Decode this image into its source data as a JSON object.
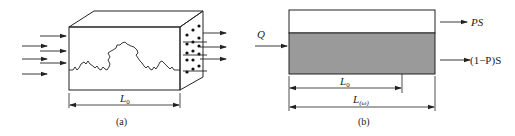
{
  "panels": [
    {
      "id": "a",
      "caption": "(a)",
      "dimension_label": "L",
      "dimension_sub": "0"
    },
    {
      "id": "b",
      "caption": "(b)",
      "input_label": "Q",
      "output_top_label": "PS",
      "output_bottom_label": "(1−P)S",
      "dim_inner_label": "L",
      "dim_inner_sub": "0",
      "dim_outer_label": "L",
      "dim_outer_sub": "(ω)"
    }
  ],
  "colors": {
    "line": "#222222",
    "shaded_band": "#9a9a9a",
    "background": "#ffffff"
  }
}
